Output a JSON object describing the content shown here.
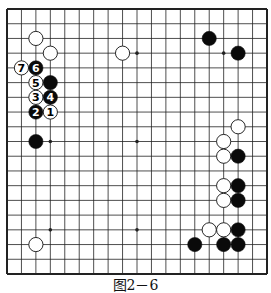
{
  "diagram": {
    "type": "go-board",
    "size": 19,
    "caption": "图2－6",
    "colors": {
      "line": "#222222",
      "black_stone": "#0a0a0a",
      "white_stone": "#ffffff",
      "stone_outline": "#111111"
    },
    "star_points": [
      {
        "col": 3,
        "row": 3
      },
      {
        "col": 9,
        "row": 3
      },
      {
        "col": 15,
        "row": 3
      },
      {
        "col": 3,
        "row": 9
      },
      {
        "col": 9,
        "row": 9
      },
      {
        "col": 15,
        "row": 9
      },
      {
        "col": 3,
        "row": 15
      },
      {
        "col": 9,
        "row": 15
      },
      {
        "col": 15,
        "row": 15
      }
    ],
    "stones": [
      {
        "color": "white",
        "col": 2,
        "row": 2,
        "label": ""
      },
      {
        "color": "white",
        "col": 3,
        "row": 3,
        "label": ""
      },
      {
        "color": "white",
        "col": 1,
        "row": 4,
        "label": "7"
      },
      {
        "color": "black",
        "col": 2,
        "row": 4,
        "label": "6"
      },
      {
        "color": "white",
        "col": 2,
        "row": 5,
        "label": "5"
      },
      {
        "color": "black",
        "col": 3,
        "row": 5,
        "label": ""
      },
      {
        "color": "white",
        "col": 2,
        "row": 6,
        "label": "3"
      },
      {
        "color": "black",
        "col": 3,
        "row": 6,
        "label": "4"
      },
      {
        "color": "black",
        "col": 2,
        "row": 7,
        "label": "2"
      },
      {
        "color": "white",
        "col": 3,
        "row": 7,
        "label": "1"
      },
      {
        "color": "black",
        "col": 2,
        "row": 9,
        "label": ""
      },
      {
        "color": "white",
        "col": 2,
        "row": 16,
        "label": ""
      },
      {
        "color": "white",
        "col": 8,
        "row": 3,
        "label": ""
      },
      {
        "color": "black",
        "col": 14,
        "row": 2,
        "label": ""
      },
      {
        "color": "black",
        "col": 16,
        "row": 3,
        "label": ""
      },
      {
        "color": "white",
        "col": 16,
        "row": 8,
        "label": ""
      },
      {
        "color": "white",
        "col": 15,
        "row": 9,
        "label": ""
      },
      {
        "color": "white",
        "col": 15,
        "row": 10,
        "label": ""
      },
      {
        "color": "black",
        "col": 16,
        "row": 10,
        "label": ""
      },
      {
        "color": "white",
        "col": 15,
        "row": 12,
        "label": ""
      },
      {
        "color": "black",
        "col": 16,
        "row": 12,
        "label": ""
      },
      {
        "color": "white",
        "col": 15,
        "row": 13,
        "label": ""
      },
      {
        "color": "black",
        "col": 16,
        "row": 13,
        "label": ""
      },
      {
        "color": "white",
        "col": 14,
        "row": 15,
        "label": ""
      },
      {
        "color": "white",
        "col": 15,
        "row": 15,
        "label": ""
      },
      {
        "color": "black",
        "col": 16,
        "row": 15,
        "label": ""
      },
      {
        "color": "black",
        "col": 13,
        "row": 16,
        "label": ""
      },
      {
        "color": "black",
        "col": 15,
        "row": 16,
        "label": ""
      },
      {
        "color": "black",
        "col": 16,
        "row": 16,
        "label": ""
      }
    ]
  }
}
